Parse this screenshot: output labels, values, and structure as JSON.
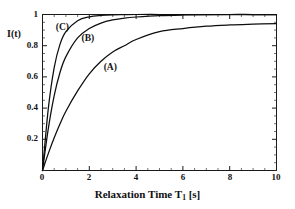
{
  "chart_data": {
    "type": "line",
    "title": "",
    "subtitle": "",
    "xlabel_prefix": "Relaxation Time T",
    "xlabel_sub": "1",
    "xlabel_suffix": " [s]",
    "xlabel_full": "Relaxation Time T1 [s]",
    "ylabel": "I(t)",
    "xlim": [
      0,
      10
    ],
    "ylim": [
      0,
      1
    ],
    "grid": false,
    "legend_position": "inline-annotations",
    "x_ticks": [
      "0",
      "2",
      "4",
      "6",
      "8",
      "10"
    ],
    "x_tick_values": [
      0,
      2,
      4,
      6,
      8,
      10
    ],
    "x_minor_tick_step": 0.5,
    "y_ticks": [
      "0.2",
      "0.4",
      "0.6",
      "0.8",
      "1"
    ],
    "y_tick_values": [
      0.2,
      0.4,
      0.6,
      0.8,
      1
    ],
    "y_minor_tick_step": 0.05,
    "x": [
      0,
      0.25,
      0.5,
      0.75,
      1,
      1.5,
      2,
      2.5,
      3,
      3.5,
      4,
      5,
      6,
      7,
      8,
      9,
      10
    ],
    "series": [
      {
        "name": "(A)",
        "label": "(A)",
        "annotation_x": 3.0,
        "annotation_y": 0.66,
        "values": [
          0,
          0.11,
          0.21,
          0.3,
          0.38,
          0.51,
          0.62,
          0.7,
          0.76,
          0.8,
          0.84,
          0.89,
          0.91,
          0.925,
          0.933,
          0.938,
          0.942
        ]
      },
      {
        "name": "(B)",
        "label": "(B)",
        "annotation_x": 2.05,
        "annotation_y": 0.845,
        "values": [
          0,
          0.27,
          0.48,
          0.63,
          0.73,
          0.85,
          0.91,
          0.945,
          0.965,
          0.977,
          0.984,
          0.993,
          0.997,
          0.999,
          1.0,
          1.0,
          1.0
        ]
      },
      {
        "name": "(C)",
        "label": "(C)",
        "annotation_x": 0.95,
        "annotation_y": 0.915,
        "values": [
          0,
          0.4,
          0.66,
          0.81,
          0.89,
          0.96,
          0.985,
          0.994,
          0.998,
          0.999,
          1.0,
          1.0,
          1.0,
          1.0,
          1.0,
          1.0,
          1.0
        ]
      }
    ],
    "colors": {
      "curve": "#0d0d0d",
      "axis": "#1a1a1a",
      "background": "#ffffff",
      "text": "#111111"
    }
  }
}
